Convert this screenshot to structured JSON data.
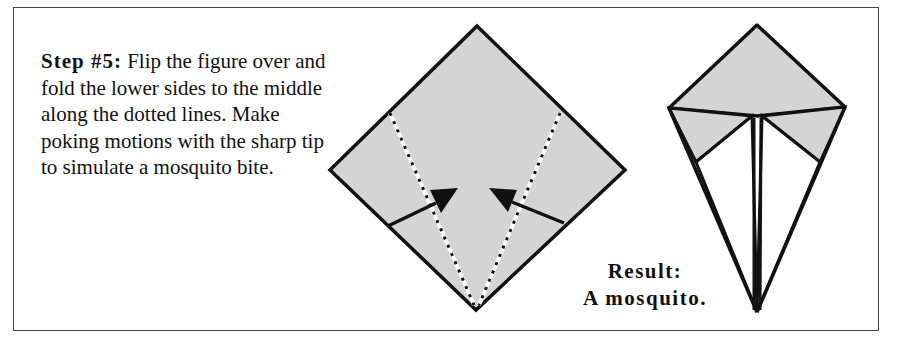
{
  "instruction": {
    "step_label": "Step #5:",
    "text": " Flip the figure over and fold the lower sides to the middle along the dotted lines. Make poking motions with the sharp tip to simulate a mosquito bite."
  },
  "result": {
    "line1": "Result:",
    "line2": "A mosquito."
  },
  "colors": {
    "paper_fill": "#d4d4d4",
    "line": "#111111",
    "border": "#444444"
  },
  "figures": [
    {
      "name": "folding-diagram",
      "description": "Diamond with dotted fold lines and arrows toward center"
    },
    {
      "name": "result-mosquito",
      "description": "Finished origami mosquito shape"
    }
  ]
}
